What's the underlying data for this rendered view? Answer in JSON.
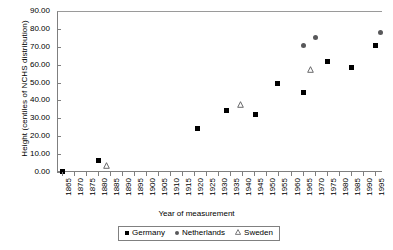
{
  "chart_data": {
    "type": "scatter",
    "title": "",
    "xlabel": "Year of measurement",
    "ylabel": "Height (centiles of NCHS distribution)",
    "xlim": [
      1863,
      1998
    ],
    "ylim": [
      0,
      90
    ],
    "ytick_step": 10,
    "xtick_step": 5,
    "grid": false,
    "legend_position": "bottom",
    "ytick_labels": [
      "90.00",
      "80.00",
      "70.00",
      "60.00",
      "50.00",
      "40.00",
      "30.00",
      "20.00",
      "10.00",
      "0.00"
    ],
    "ytick_values": [
      90,
      80,
      70,
      60,
      50,
      40,
      30,
      20,
      10,
      0
    ],
    "xtick_labels": [
      "1865",
      "1870",
      "1875",
      "1880",
      "1885",
      "1890",
      "1895",
      "1900",
      "1905",
      "1910",
      "1915",
      "1920",
      "1925",
      "1930",
      "1935",
      "1940",
      "1945",
      "1950",
      "1955",
      "1960",
      "1965",
      "1970",
      "1975",
      "1980",
      "1985",
      "1990",
      "1995"
    ],
    "xtick_values": [
      1865,
      1870,
      1875,
      1880,
      1885,
      1890,
      1895,
      1900,
      1905,
      1910,
      1915,
      1920,
      1925,
      1930,
      1935,
      1940,
      1945,
      1950,
      1955,
      1960,
      1965,
      1970,
      1975,
      1980,
      1985,
      1990,
      1995
    ],
    "series": [
      {
        "name": "Germany",
        "marker": "filled-square",
        "color": "#000000",
        "points": [
          {
            "x": 1865,
            "y": 1.0
          },
          {
            "x": 1880,
            "y": 7.0
          },
          {
            "x": 1921,
            "y": 24.8
          },
          {
            "x": 1933,
            "y": 35.2
          },
          {
            "x": 1945,
            "y": 32.7
          },
          {
            "x": 1954,
            "y": 49.8
          },
          {
            "x": 1965,
            "y": 45.1
          },
          {
            "x": 1975,
            "y": 62.6
          },
          {
            "x": 1985,
            "y": 59.1
          },
          {
            "x": 1995,
            "y": 71.0
          }
        ]
      },
      {
        "name": "Netherlands",
        "marker": "filled-circle",
        "color": "#58585a",
        "points": [
          {
            "x": 1965,
            "y": 71.5
          },
          {
            "x": 1970,
            "y": 76.0
          },
          {
            "x": 1997,
            "y": 78.4
          }
        ]
      },
      {
        "name": "Sweden",
        "marker": "open-triangle",
        "color": "#58585a",
        "points": [
          {
            "x": 1883,
            "y": 4.0
          },
          {
            "x": 1939,
            "y": 38.2
          },
          {
            "x": 1968,
            "y": 58.0
          }
        ]
      }
    ]
  },
  "legend": {
    "items": [
      {
        "label": "Germany"
      },
      {
        "label": "Netherlands"
      },
      {
        "label": "Sweden"
      }
    ]
  }
}
